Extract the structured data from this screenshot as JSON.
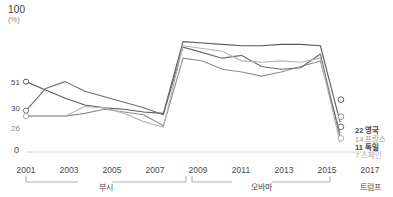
{
  "chart_data": {
    "type": "line",
    "title": "",
    "xlabel": "",
    "ylabel": "(%)",
    "ylim": [
      0,
      100
    ],
    "xlim": [
      2001,
      2017
    ],
    "grid": false,
    "legend_position": "right-end-of-line",
    "axis_top_label": "100",
    "unit_label": "(%)",
    "zero_label": "0",
    "y_ticks": [
      {
        "value": "51",
        "y": 51,
        "emphasis": "dark"
      },
      {
        "value": "30",
        "y": 30,
        "emphasis": "dark"
      },
      {
        "value": "26",
        "y": 26,
        "emphasis": "light"
      }
    ],
    "x_ticks": [
      "2001",
      "2003",
      "2005",
      "2007",
      "2009",
      "2011",
      "2013",
      "2015",
      "2017"
    ],
    "eras": [
      {
        "label": "부시",
        "start": 2001,
        "end": 2008
      },
      {
        "label": "오바마",
        "start": 2009,
        "end": 2016
      },
      {
        "label": "트럼프",
        "start": 2017,
        "end": 2017
      }
    ],
    "x": [
      2001,
      2002,
      2003,
      2004,
      2005,
      2006,
      2007,
      2008,
      2009,
      2010,
      2011,
      2012,
      2013,
      2014,
      2015,
      2016,
      2017
    ],
    "series": [
      {
        "name": "영국",
        "color": "#5a5a5a",
        "end_value": "22",
        "end_label": "22 영국",
        "values": [
          51,
          45,
          39,
          34,
          32,
          31,
          29,
          28,
          80,
          79,
          78,
          77,
          77,
          78,
          78,
          77,
          22
        ]
      },
      {
        "name": "프랑스",
        "color": "#8f8f8f",
        "end_value": "14",
        "end_label": "14 프랑스",
        "values": [
          26,
          26,
          26,
          28,
          31,
          29,
          27,
          19,
          68,
          66,
          60,
          58,
          55,
          58,
          62,
          66,
          14
        ]
      },
      {
        "name": "독일",
        "color": "#6e6e6e",
        "end_value": "11",
        "end_label": "11 독일",
        "values": [
          30,
          46,
          51,
          44,
          40,
          36,
          32,
          27,
          76,
          72,
          68,
          70,
          62,
          60,
          61,
          71,
          11
        ]
      },
      {
        "name": "스페인",
        "color": "#b4b4b4",
        "end_value": "7",
        "end_label": "7 스페인",
        "values": [
          26,
          26,
          26,
          33,
          32,
          28,
          22,
          18,
          77,
          75,
          73,
          66,
          65,
          66,
          65,
          68,
          7
        ]
      }
    ]
  }
}
